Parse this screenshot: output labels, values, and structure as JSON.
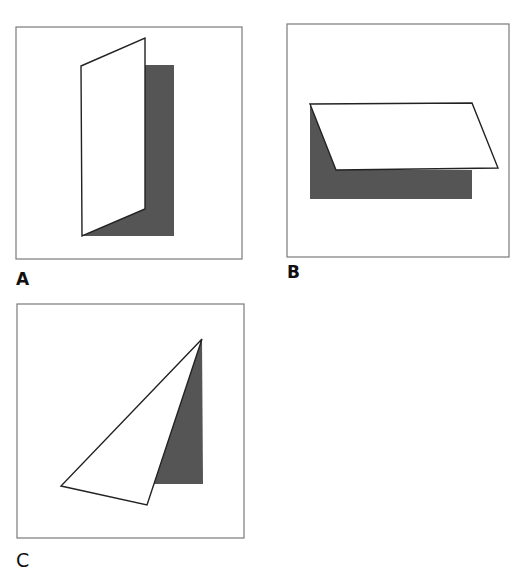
{
  "figure": {
    "panels": [
      {
        "id": "A",
        "label": "A",
        "description": "Sheet folded vertically, front flap turned up-left",
        "frame": {
          "x": 16,
          "y": 27,
          "w": 226,
          "h": 232
        },
        "shadow_polygon": "145,65 174,65 174,236 82,236 145,209",
        "flap_polygon": "81,66 145,38 145,209 82,236"
      },
      {
        "id": "B",
        "label": "B",
        "description": "Sheet folded horizontally, front flap slanted right",
        "frame": {
          "x": 287,
          "y": 24,
          "w": 222,
          "h": 233
        },
        "shadow_polygon": "310,104 336,170 472,170 472,199 310,199",
        "flap_polygon": "310,104 472,103 498,168 336,170"
      },
      {
        "id": "C",
        "label": "C",
        "description": "Sheet folded diagonally into a triangle",
        "frame": {
          "x": 17,
          "y": 304,
          "w": 227,
          "h": 234
        },
        "shadow_polygon": "202,339 203,484 154,484",
        "flap_polygon": "202,339 61,486 147,505"
      }
    ],
    "colors": {
      "frame_stroke": "#7a7a7a",
      "shape_stroke": "#222222",
      "shadow_fill": "#555555",
      "flap_fill": "#ffffff",
      "background": "#ffffff"
    }
  }
}
